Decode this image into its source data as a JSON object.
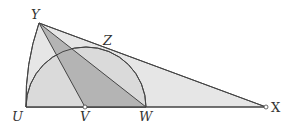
{
  "diagram": {
    "title": "",
    "colors": {
      "background": "#ffffff",
      "light_fill": "#e4e4e4",
      "semicircle_fill": "#d9d9d9",
      "dark_fill": "#b3b3b3",
      "stroke": "#444444"
    },
    "points": {
      "Y": {
        "label": "Y",
        "x": 39,
        "y": 23
      },
      "Z": {
        "label": "Z",
        "x": 107,
        "y": 48
      },
      "U": {
        "label": "U",
        "x": 26,
        "y": 107
      },
      "V": {
        "label": "V",
        "x": 85,
        "y": 107
      },
      "W": {
        "label": "W",
        "x": 146,
        "y": 107
      },
      "X": {
        "label": "X",
        "x": 266,
        "y": 107
      }
    },
    "shapes": [
      "triangle U-Y-X (light shading, with arc U-Y centered at X)",
      "semicircle on diameter U-W centered at V, tangent to YX at Z",
      "triangle Y-V-W (dark shading)",
      "segment Y-W",
      "segment Y-V"
    ],
    "labels": {
      "Y": "Y",
      "Z": "Z",
      "U": "U",
      "V": "V",
      "W": "W",
      "X": "X"
    }
  }
}
